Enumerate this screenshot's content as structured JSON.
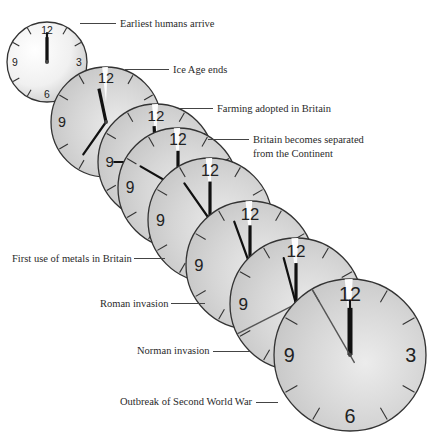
{
  "figure": {
    "events": [
      {
        "label": "Earliest humans arrive",
        "clock": {
          "cx": 47,
          "cy": 62,
          "r": 40,
          "hour_angle": 0,
          "minute_angle": 0,
          "second_angle": null,
          "bg": "#e9e9e9"
        }
      },
      {
        "label": "Ice Age ends",
        "clock": {
          "cx": 106,
          "cy": 122,
          "r": 55,
          "hour_angle": -12,
          "minute_angle": 215,
          "second_angle": null,
          "bg": "#cfcfcf"
        }
      },
      {
        "label": "Farming adopted in Britain",
        "clock": {
          "cx": 156,
          "cy": 162,
          "r": 58,
          "hour_angle": -3,
          "minute_angle": 270,
          "second_angle": null,
          "bg": "#d3d3d3"
        }
      },
      {
        "label": "Britain becomes separated from the Continent",
        "clock": {
          "cx": 178,
          "cy": 188,
          "r": 60,
          "hour_angle": 0,
          "minute_angle": 300,
          "second_angle": null,
          "bg": "#d6d6d6"
        }
      },
      {
        "label": "First use of metals in Britain",
        "clock": {
          "cx": 210,
          "cy": 220,
          "r": 62,
          "hour_angle": 0,
          "minute_angle": 325,
          "second_angle": null,
          "bg": "#d4d4d4"
        }
      },
      {
        "label": "Roman invasion",
        "clock": {
          "cx": 250,
          "cy": 265,
          "r": 64,
          "hour_angle": 0,
          "minute_angle": 340,
          "second_angle": null,
          "bg": "#d2d2d2"
        }
      },
      {
        "label": "Norman invasion",
        "clock": {
          "cx": 296,
          "cy": 304,
          "r": 66,
          "hour_angle": 0,
          "minute_angle": 345,
          "second_angle": 243,
          "bg": "#d0d0d0"
        }
      },
      {
        "label": "Outbreak of Second World War",
        "clock": {
          "cx": 350,
          "cy": 355,
          "r": 76,
          "hour_angle": 0,
          "minute_angle": 0,
          "second_angle": 330,
          "bg": "#dddddd"
        }
      }
    ],
    "numerals": {
      "twelve": "12",
      "three": "3",
      "six": "6",
      "nine": "9"
    },
    "colors": {
      "face_stroke": "#333333",
      "hand": "#111111",
      "highlight": "#ffffff",
      "text": "#2a2a2a",
      "leader": "#444444"
    }
  },
  "labels": [
    {
      "text": "Earliest humans arrive",
      "x": 120,
      "y": 17,
      "line_x1": 80,
      "line_x2": 116,
      "line_y": 23
    },
    {
      "text": "Ice Age ends",
      "x": 173,
      "y": 63,
      "line_x1": 125,
      "line_x2": 169,
      "line_y": 69
    },
    {
      "text": "Farming adopted in Britain",
      "x": 217,
      "y": 102,
      "line_x1": 180,
      "line_x2": 213,
      "line_y": 108
    },
    {
      "text": "Britain becomes separated",
      "x": 253,
      "y": 133,
      "line_x1": 208,
      "line_x2": 249,
      "line_y": 139
    },
    {
      "text": "from the Continent",
      "x": 253,
      "y": 147,
      "line_x1": null,
      "line_x2": null,
      "line_y": null
    },
    {
      "text": "First use of metals in Britain",
      "x": 12,
      "y": 252,
      "line_x1": 134,
      "line_x2": 165,
      "line_y": 258
    },
    {
      "text": "Roman invasion",
      "x": 100,
      "y": 297,
      "line_x1": 171,
      "line_x2": 205,
      "line_y": 303
    },
    {
      "text": "Norman invasion",
      "x": 137,
      "y": 344,
      "line_x1": 213,
      "line_x2": 250,
      "line_y": 351
    },
    {
      "text": "Outbreak of Second World War",
      "x": 120,
      "y": 395,
      "line_x1": 256,
      "line_x2": 278,
      "line_y": 402
    }
  ]
}
